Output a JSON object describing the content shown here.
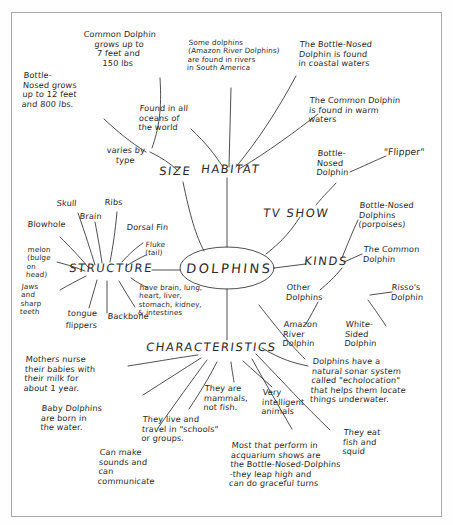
{
  "document": {
    "title": "DOLPHINS",
    "type": "hand-drawn mind map",
    "ink_color": "#2a2a2a",
    "paper_color": "#ffffff",
    "frame_color": "#a9a9a9"
  },
  "center": {
    "label": "DOLPHINS"
  },
  "branches": {
    "size": {
      "label": "SIZE",
      "children": [
        {
          "id": "size-varies",
          "text": "varies by\ntype"
        },
        {
          "id": "size-bottlenose",
          "text": "Bottle-\nNosed grows\nup to 12 feet\nand 800 lbs."
        },
        {
          "id": "size-common",
          "text": "Common Dolphin\ngrows up to\n7 feet and\n150 lbs"
        }
      ]
    },
    "habitat": {
      "label": "HABITAT",
      "children": [
        {
          "id": "habitat-all-oceans",
          "text": "Found in all\noceans of\nthe world"
        },
        {
          "id": "habitat-rivers",
          "text": "Some dolphins\n(Amazon River Dolphins)\nare found in rivers\nin South America"
        },
        {
          "id": "habitat-coastal",
          "text": "The Bottle-Nosed\nDolphin is found\nin coastal waters"
        },
        {
          "id": "habitat-warm",
          "text": "The Common Dolphin\nis found in warm\nwaters"
        }
      ]
    },
    "tvshow": {
      "label": "TV SHOW",
      "children": [
        {
          "id": "tv-bottlenose",
          "text": "Bottle-\nNosed\nDolphin"
        },
        {
          "id": "tv-flipper",
          "text": "\"Flipper\""
        }
      ]
    },
    "kinds": {
      "label": "KINDS",
      "children": [
        {
          "id": "kinds-bottlenose",
          "text": "Bottle-Nosed\nDolphins\n(porpoises)"
        },
        {
          "id": "kinds-common",
          "text": "The Common\nDolphin"
        },
        {
          "id": "kinds-other",
          "text": "Other\nDolphins"
        },
        {
          "id": "kinds-rissos",
          "text": "Risso's\nDolphin"
        },
        {
          "id": "kinds-amazon",
          "text": "Amazon\nRiver\nDolphin"
        },
        {
          "id": "kinds-whitesided",
          "text": "White-\nSided\nDolphin"
        }
      ]
    },
    "structure": {
      "label": "STRUCTURE",
      "children": [
        {
          "id": "struct-skull",
          "text": "Skull"
        },
        {
          "id": "struct-ribs",
          "text": "Ribs"
        },
        {
          "id": "struct-brain",
          "text": "Brain"
        },
        {
          "id": "struct-blowhole",
          "text": "Blowhole"
        },
        {
          "id": "struct-dorsalfin",
          "text": "Dorsal Fin"
        },
        {
          "id": "struct-fluke",
          "text": "Fluke\n(tail)"
        },
        {
          "id": "struct-melon",
          "text": "melon\n(bulge\non\nhead)"
        },
        {
          "id": "struct-jaws",
          "text": "Jaws\nand\nsharp\nteeth"
        },
        {
          "id": "struct-tongue",
          "text": "tongue"
        },
        {
          "id": "struct-flippers",
          "text": "flippers"
        },
        {
          "id": "struct-backbone",
          "text": "Backbone"
        },
        {
          "id": "struct-organs",
          "text": "have brain, lung,\nheart, liver,\nstomach, kidney,\n& intestines"
        }
      ]
    },
    "characteristics": {
      "label": "CHARACTERISTICS",
      "children": [
        {
          "id": "char-nurse",
          "text": "Mothers nurse\ntheir babies with\ntheir milk for\nabout 1 year."
        },
        {
          "id": "char-born",
          "text": "Baby Dolphins\nare born in\nthe water."
        },
        {
          "id": "char-sounds",
          "text": "Can make\nsounds and\ncan\ncommunicate"
        },
        {
          "id": "char-schools",
          "text": "They live and\ntravel in \"schools\"\nor groups."
        },
        {
          "id": "char-mammals",
          "text": "They are\nmammals,\nnot fish."
        },
        {
          "id": "char-intelligent",
          "text": "Very\nintelligent\nanimals"
        },
        {
          "id": "char-aquarium",
          "text": "Most that perform in\nacquarium shows are\nthe Bottle-Nosed-Dolphins\n-they leap high and\ncan do graceful turns"
        },
        {
          "id": "char-eat",
          "text": "They eat\nfish and\nsquid"
        },
        {
          "id": "char-sonar",
          "text": "Dolphins have a\nnatural sonar system\ncalled \"echolocation\"\nthat helps them locate\nthings underwater."
        }
      ]
    }
  }
}
